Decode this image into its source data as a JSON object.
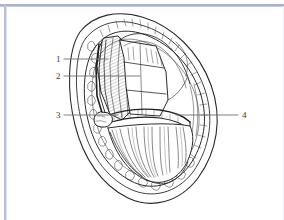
{
  "figure": {
    "style": {
      "background_color": "#ffffff",
      "ink_color": "#2b2b2b",
      "leader_line_color": "#6e6e6e",
      "frame_color": "#9aa3bd"
    },
    "labels": [
      {
        "id": "1",
        "text": "1",
        "side": "left",
        "x": 56,
        "y": 55,
        "leader_from_x": 64,
        "leader_to_x": 108,
        "leader_y": 59
      },
      {
        "id": "2",
        "text": "2",
        "side": "left",
        "x": 56,
        "y": 72,
        "leader_from_x": 64,
        "leader_to_x": 140,
        "leader_y": 76
      },
      {
        "id": "3",
        "text": "3",
        "side": "left",
        "x": 56,
        "y": 111,
        "leader_from_x": 64,
        "leader_to_x": 118,
        "leader_y": 115
      },
      {
        "id": "4",
        "text": "4",
        "side": "right",
        "x": 242,
        "y": 111,
        "leader_from_x": 238,
        "leader_to_x": 176,
        "leader_y": 115
      }
    ],
    "watermark": ""
  }
}
